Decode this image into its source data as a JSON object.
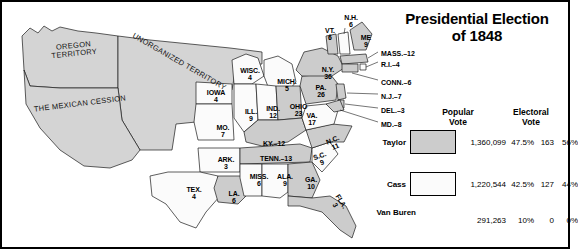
{
  "title": {
    "line1": "Presidential Election",
    "line2": "of 1848"
  },
  "territories": [
    {
      "name": "oregon-territory",
      "label": "OREGON\nTERRITORY",
      "x": 36,
      "y": 42,
      "w": 76,
      "rot": -6
    },
    {
      "name": "unorganized-territory",
      "label": "UNORGANIZED TERRITORY",
      "x": 104,
      "y": 58,
      "w": 150,
      "rot": 30
    },
    {
      "name": "mexican-cession",
      "label": "THE MEXICAN CESSION",
      "x": 18,
      "y": 100,
      "w": 124,
      "rot": -7
    }
  ],
  "states": [
    {
      "name": "iowa",
      "label": "IOWA",
      "votes": "4",
      "x": 199,
      "y": 89,
      "w": 34,
      "party": "cass"
    },
    {
      "name": "missouri",
      "label": "MO.",
      "votes": "7",
      "x": 210,
      "y": 124,
      "w": 26,
      "party": "cass"
    },
    {
      "name": "arkansas",
      "label": "ARK.",
      "votes": "3",
      "x": 213,
      "y": 156,
      "w": 26,
      "party": "cass"
    },
    {
      "name": "texas",
      "label": "TEX.",
      "votes": "4",
      "x": 181,
      "y": 186,
      "w": 26,
      "party": "cass"
    },
    {
      "name": "louisiana",
      "label": "LA.",
      "votes": "6",
      "x": 224,
      "y": 190,
      "w": 20,
      "party": "taylor"
    },
    {
      "name": "wisconsin",
      "label": "WISC.",
      "votes": "4",
      "x": 235,
      "y": 67,
      "w": 30,
      "party": "cass"
    },
    {
      "name": "illinois",
      "label": "ILL.",
      "votes": "9",
      "x": 240,
      "y": 108,
      "w": 22,
      "party": "cass"
    },
    {
      "name": "michigan",
      "label": "MICH.",
      "votes": "5",
      "x": 272,
      "y": 78,
      "w": 30,
      "party": "cass"
    },
    {
      "name": "indiana",
      "label": "IND.",
      "votes": "12",
      "x": 262,
      "y": 105,
      "w": 22,
      "party": "cass"
    },
    {
      "name": "ohio",
      "label": "OHIO",
      "votes": "23",
      "x": 285,
      "y": 103,
      "w": 27,
      "party": "taylor"
    },
    {
      "name": "kentucky",
      "label": "KY.",
      "votes": "12",
      "x": 252,
      "y": 140,
      "w": 44,
      "party": "taylor",
      "inline": true
    },
    {
      "name": "tennessee",
      "label": "TENN.",
      "votes": "13",
      "x": 250,
      "y": 155,
      "w": 52,
      "party": "taylor",
      "inline": true
    },
    {
      "name": "mississippi",
      "label": "MISS.",
      "votes": "6",
      "x": 246,
      "y": 173,
      "w": 26,
      "party": "cass"
    },
    {
      "name": "alabama",
      "label": "ALA.",
      "votes": "9",
      "x": 273,
      "y": 173,
      "w": 24,
      "party": "cass"
    },
    {
      "name": "georgia",
      "label": "GA.",
      "votes": "10",
      "x": 300,
      "y": 176,
      "w": 22,
      "party": "taylor"
    },
    {
      "name": "florida",
      "label": "FLA.",
      "votes": "3",
      "x": 325,
      "y": 196,
      "w": 26,
      "party": "taylor",
      "rot": 58
    },
    {
      "name": "south-carolina",
      "label": "S.C.",
      "votes": "9",
      "x": 311,
      "y": 152,
      "w": 20,
      "party": "cass",
      "rot": -20
    },
    {
      "name": "north-carolina",
      "label": "N.C.",
      "votes": "11",
      "x": 323,
      "y": 136,
      "w": 22,
      "party": "taylor",
      "rot": -22
    },
    {
      "name": "virginia",
      "label": "VA.",
      "votes": "17",
      "x": 301,
      "y": 112,
      "w": 22,
      "party": "cass"
    },
    {
      "name": "pennsylvania",
      "label": "PA.",
      "votes": "26",
      "x": 310,
      "y": 84,
      "w": 22,
      "party": "taylor"
    },
    {
      "name": "new-york",
      "label": "N.Y.",
      "votes": "36",
      "x": 316,
      "y": 66,
      "w": 24,
      "party": "taylor"
    },
    {
      "name": "vermont",
      "label": "VT.",
      "votes": "6",
      "x": 320,
      "y": 27,
      "w": 20,
      "party": "taylor"
    },
    {
      "name": "new-hampshire",
      "label": "N.H.",
      "votes": "6",
      "x": 339,
      "y": 14,
      "w": 24,
      "party": "cass"
    },
    {
      "name": "maine",
      "label": "ME",
      "votes": "9",
      "x": 356,
      "y": 34,
      "w": 20,
      "party": "taylor"
    }
  ],
  "leaders": [
    {
      "name": "massachusetts",
      "label": "MASS.–12",
      "x": 381,
      "y": 50
    },
    {
      "name": "rhode-island",
      "label": "R.I.–4",
      "x": 381,
      "y": 61
    },
    {
      "name": "connecticut",
      "label": "CONN.–6",
      "x": 381,
      "y": 79
    },
    {
      "name": "new-jersey",
      "label": "N.J.–7",
      "x": 381,
      "y": 93
    },
    {
      "name": "delaware",
      "label": "DEL.–3",
      "x": 381,
      "y": 107
    },
    {
      "name": "maryland",
      "label": "MD.–8",
      "x": 381,
      "y": 121
    }
  ],
  "results": {
    "headers": {
      "popular": "Popular\nVote",
      "electoral": "Electoral\nVote"
    },
    "rows": [
      {
        "name": "taylor",
        "candidate": "Taylor",
        "swatch": "#cccccc",
        "has_swatch": true,
        "popular_votes": "1,360,099",
        "popular_pct": "47.5%",
        "electoral_votes": "163",
        "electoral_pct": "56%"
      },
      {
        "name": "cass",
        "candidate": "Cass",
        "swatch": "#fbfbfb",
        "has_swatch": true,
        "popular_votes": "1,220,544",
        "popular_pct": "42.5%",
        "electoral_votes": "127",
        "electoral_pct": "44%"
      },
      {
        "name": "van-buren",
        "candidate": "Van Buren",
        "swatch": null,
        "has_swatch": false,
        "popular_votes": "291,263",
        "popular_pct": "10%",
        "electoral_votes": "0",
        "electoral_pct": "0%"
      }
    ]
  },
  "colors": {
    "taylor_fill": "#cccccc",
    "cass_fill": "#fbfbfb",
    "territory_fill": "#d4d4d4",
    "outline": "#1a1a1a"
  }
}
